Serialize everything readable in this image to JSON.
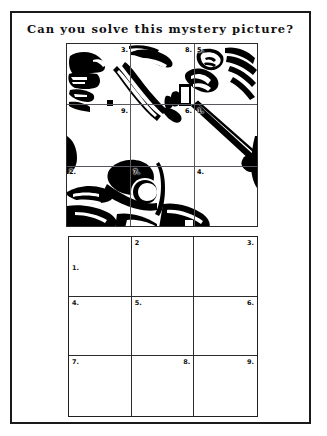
{
  "page": {
    "title": "Can you solve this mystery picture?",
    "background_color": "#ffffff",
    "border_color": "#1a1a1a",
    "ink_color": "#000000"
  },
  "picture_grid": {
    "name": "mystery-picture",
    "rows": 3,
    "columns": 3,
    "artwork_description": "Black and white line-art of baseball players; batter swinging a bat, catcher in profile at left",
    "cells": [
      {
        "label": "3.",
        "position": "top-right"
      },
      {
        "label": "8.",
        "position": "top-right"
      },
      {
        "label": "5.",
        "position": "top-left"
      },
      {
        "label": "9.",
        "position": "top-right"
      },
      {
        "label": "6.",
        "position": "top-right"
      },
      {
        "label": "1.",
        "position": "top-left"
      },
      {
        "label": "2.",
        "position": "top-left"
      },
      {
        "label": "7.",
        "position": "top-left"
      },
      {
        "label": "4.",
        "position": "top-left"
      }
    ]
  },
  "answer_grid": {
    "name": "answer-grid",
    "rows": 3,
    "columns": 3,
    "cells": [
      {
        "label": "1.",
        "position": "middle-left",
        "value": ""
      },
      {
        "label": "2",
        "position": "top-left",
        "value": ""
      },
      {
        "label": "3.",
        "position": "top-right",
        "value": ""
      },
      {
        "label": "4.",
        "position": "top-left",
        "value": ""
      },
      {
        "label": "5.",
        "position": "top-left",
        "value": ""
      },
      {
        "label": "6.",
        "position": "top-right",
        "value": ""
      },
      {
        "label": "7.",
        "position": "top-left",
        "value": ""
      },
      {
        "label": "8.",
        "position": "top-right",
        "value": ""
      },
      {
        "label": "9.",
        "position": "top-right",
        "value": ""
      }
    ]
  }
}
